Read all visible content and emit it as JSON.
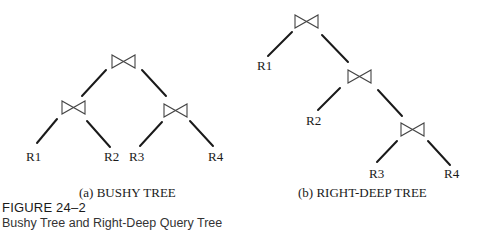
{
  "figure": {
    "number": "FIGURE 24–2",
    "title": "Bushy Tree and Right-Deep Query Tree"
  },
  "bushy_tree": {
    "caption": "(a) BUSHY TREE",
    "join_icon": "bowtie-join-icon",
    "leaves": [
      "R1",
      "R2",
      "R3",
      "R4"
    ]
  },
  "right_deep_tree": {
    "caption": "(b) RIGHT-DEEP TREE",
    "join_icon": "bowtie-join-icon",
    "leaves": [
      "R1",
      "R2",
      "R3",
      "R4"
    ]
  }
}
